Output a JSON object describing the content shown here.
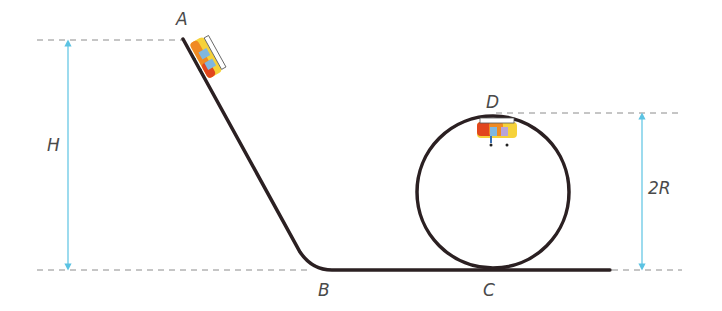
{
  "diagram": {
    "points": {
      "A": {
        "label": "A",
        "x": 180,
        "y": 12
      },
      "B": {
        "label": "B",
        "x": 319,
        "y": 283
      },
      "C": {
        "label": "C",
        "x": 483,
        "y": 283
      },
      "D": {
        "label": "D",
        "x": 486,
        "y": 94
      }
    },
    "dimensions": {
      "height_label": "H",
      "loop_height_label": "2R"
    },
    "colors": {
      "track": "#2b2022",
      "dashed": "#8c8c8c",
      "dimension_arrow": "#5bc3e3",
      "label": "#4a4a4a",
      "cart_yellow": "#f6d23a",
      "cart_red": "#e2461d",
      "cart_orange": "#f08a22"
    }
  }
}
